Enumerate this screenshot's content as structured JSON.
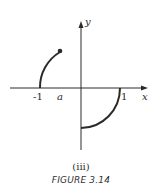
{
  "figure": {
    "subcaption": "(iii)",
    "caption": "FIGURE 3.14"
  },
  "axes": {
    "x_label": "x",
    "y_label": "y",
    "ticks": {
      "neg_one": "-1",
      "a": "a",
      "one": "1"
    }
  },
  "curves": [
    {
      "name": "upper-left-arc",
      "description": "arc of unit circle from (-1,0) up to endpoint at x=a, ending in a filled dot"
    },
    {
      "name": "lower-right-arc",
      "description": "quarter arc of unit circle from (1,0) down to (0,-1)"
    }
  ],
  "colors": {
    "ink": "#2a2a2a",
    "background": "#ffffff"
  }
}
